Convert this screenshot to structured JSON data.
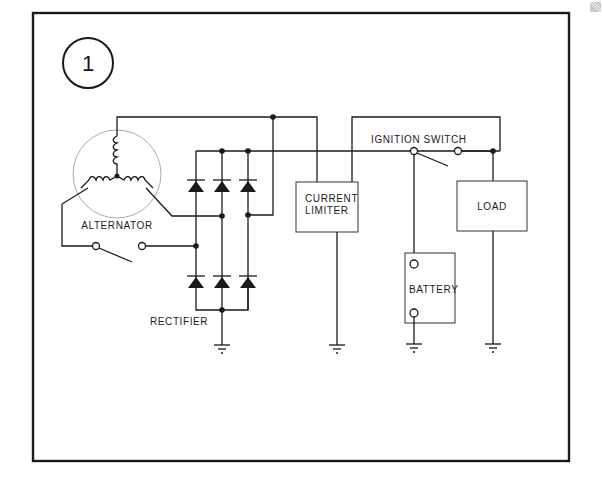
{
  "figure": {
    "number": "1",
    "labels": {
      "alternator": "ALTERNATOR",
      "rectifier": "RECTIFIER",
      "current_limiter_line1": "CURRENT",
      "current_limiter_line2": "LIMITER",
      "ignition_switch": "IGNITION SWITCH",
      "load": "LOAD",
      "battery": "BATTERY"
    },
    "components": [
      {
        "name": "alternator",
        "type": "three-phase wye winding"
      },
      {
        "name": "rectifier",
        "type": "6-diode bridge"
      },
      {
        "name": "current limiter",
        "type": "box"
      },
      {
        "name": "ignition switch",
        "type": "SPST switch"
      },
      {
        "name": "load",
        "type": "box"
      },
      {
        "name": "battery",
        "type": "box with two terminals"
      },
      {
        "name": "ground",
        "count": 4
      }
    ],
    "colors": {
      "ink": "#1a1a1a",
      "background": "#ffffff"
    }
  }
}
